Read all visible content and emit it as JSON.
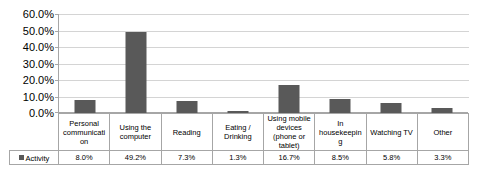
{
  "chart_data": {
    "type": "bar",
    "title": "",
    "xlabel": "",
    "ylabel": "",
    "ylim": [
      0,
      60
    ],
    "ytick_labels": [
      "60.0%",
      "50.0%",
      "40.0%",
      "30.0%",
      "20.0%",
      "10.0%",
      "0.0%"
    ],
    "ytick_values": [
      60,
      50,
      40,
      30,
      20,
      10,
      0
    ],
    "grid": true,
    "legend_position": "table-left",
    "series_name": "Activity",
    "series_color": "#595959",
    "categories": [
      "Personal communication",
      "Using the computer",
      "Reading",
      "Eating / Drinking",
      "Using mobile devices (phone or tablet)",
      "In housekeeping",
      "Watching TV",
      "Other"
    ],
    "category_label_lines": [
      [
        "Personal",
        "communicati",
        "on"
      ],
      [
        "Using the",
        "computer"
      ],
      [
        "Reading"
      ],
      [
        "Eating /",
        "Drinking"
      ],
      [
        "Using mobile",
        "devices",
        "(phone or",
        "tablet)"
      ],
      [
        "In",
        "housekeepin",
        "g"
      ],
      [
        "Watching TV"
      ],
      [
        "Other"
      ]
    ],
    "values": [
      8.0,
      49.2,
      7.3,
      1.3,
      16.7,
      8.5,
      5.8,
      3.3
    ],
    "value_labels": [
      "8.0%",
      "49.2%",
      "7.3%",
      "1.3%",
      "16.7%",
      "8.5%",
      "5.8%",
      "3.3%"
    ]
  },
  "colors": {
    "bar": "#595959",
    "gridline": "#d4d4d4",
    "axis": "#a6a6a6",
    "background": "#ffffff",
    "text": "#000000"
  }
}
